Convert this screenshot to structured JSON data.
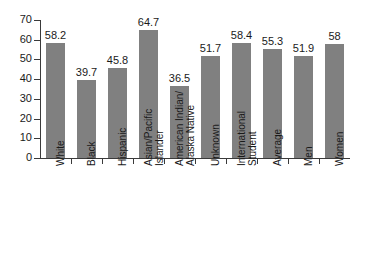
{
  "chart_data": {
    "type": "bar",
    "title": "",
    "subtitle": "",
    "xlabel": "",
    "ylabel": "",
    "ylim": [
      0,
      70
    ],
    "y_ticks": [
      0,
      10,
      20,
      30,
      40,
      50,
      60,
      70
    ],
    "y_tick_labels": [
      "0",
      "10",
      "20",
      "30",
      "40",
      "50",
      "60",
      "70"
    ],
    "grid": false,
    "legend": false,
    "legend_position": "none",
    "bar_color": "#808080",
    "axis_color": "#3a3a3a",
    "background_color": "#ffffff",
    "categories": [
      "White",
      "Black",
      "Hispanic",
      "Asian/Pacific Islander",
      "American Indian/ Alaska Native",
      "Unknown",
      "International Student",
      "Average",
      "Men",
      "Women"
    ],
    "category_label_lines": [
      [
        "White"
      ],
      [
        "Black"
      ],
      [
        "Hispanic"
      ],
      [
        "Asian/Pacific",
        "Islander"
      ],
      [
        "American Indian/",
        "Alaska Native"
      ],
      [
        "Unknown"
      ],
      [
        "International",
        "Student"
      ],
      [
        "Average"
      ],
      [
        "Men"
      ],
      [
        "Women"
      ]
    ],
    "values": [
      58.2,
      39.7,
      45.8,
      64.7,
      36.5,
      51.7,
      58.4,
      55.3,
      51.9,
      58
    ],
    "value_labels": [
      "58.2",
      "39.7",
      "45.8",
      "64.7",
      "36.5",
      "51.7",
      "58.4",
      "55.3",
      "51.9",
      "58"
    ]
  }
}
